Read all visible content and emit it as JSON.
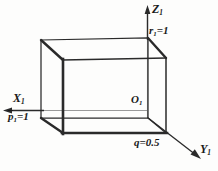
{
  "figure": {
    "type": "3d-cuboid-coordinate-diagram",
    "stroke_color": "#1a1a1a",
    "axis_color": "#8a8a8a",
    "background_color": "#fdfdfc"
  },
  "axes": {
    "vertical": {
      "name": "z-axis",
      "label": "Z",
      "subscript": "1"
    },
    "horizontal_left": {
      "name": "x-axis",
      "label": "X",
      "subscript": "1"
    },
    "diagonal_right": {
      "name": "y-axis",
      "label": "Y",
      "subscript": "1"
    }
  },
  "origin": {
    "label": "O",
    "subscript": "1"
  },
  "parameters": [
    {
      "name": "r1",
      "symbol": "r",
      "subscript": "1",
      "equals": "=",
      "value": "1",
      "text": "r₁=1",
      "axis": "z-axis"
    },
    {
      "name": "p1",
      "symbol": "p",
      "subscript": "1",
      "equals": "=",
      "value": "1",
      "text": "p̄₁=1",
      "axis": "x-axis",
      "overbar": true
    },
    {
      "name": "q",
      "symbol": "q",
      "subscript": "",
      "equals": "=",
      "value": "0.5",
      "text": "q=0.5",
      "axis": "y-axis"
    }
  ],
  "geometry": {
    "cuboid": {
      "back_face": {
        "top_left": [
          41,
          40
        ],
        "top_right": [
          148,
          38
        ],
        "bottom_right": [
          148,
          118
        ],
        "bottom_left": [
          41,
          118
        ]
      },
      "front_face": {
        "top_left": [
          63,
          60
        ],
        "top_right": [
          166,
          58
        ],
        "bottom_right": [
          166,
          133
        ],
        "bottom_left": [
          63,
          133
        ]
      }
    }
  }
}
